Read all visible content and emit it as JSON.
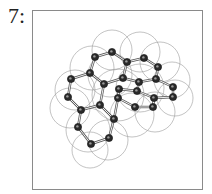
{
  "figure": {
    "label": "7:"
  },
  "atoms": [
    [
      95,
      57
    ],
    [
      112,
      52
    ],
    [
      127,
      62
    ],
    [
      144,
      58
    ],
    [
      158,
      67
    ],
    [
      90,
      73
    ],
    [
      71,
      79
    ],
    [
      104,
      84
    ],
    [
      123,
      78
    ],
    [
      139,
      82
    ],
    [
      156,
      79
    ],
    [
      173,
      87
    ],
    [
      68,
      97
    ],
    [
      119,
      89
    ],
    [
      137,
      91
    ],
    [
      118,
      98
    ],
    [
      154,
      98
    ],
    [
      173,
      97
    ],
    [
      81,
      110
    ],
    [
      100,
      105
    ],
    [
      135,
      107
    ],
    [
      153,
      107
    ],
    [
      114,
      119
    ],
    [
      78,
      127
    ],
    [
      109,
      138
    ],
    [
      91,
      144
    ]
  ],
  "bonds": [
    [
      0,
      1
    ],
    [
      1,
      2
    ],
    [
      2,
      3
    ],
    [
      3,
      4
    ],
    [
      0,
      5
    ],
    [
      5,
      6
    ],
    [
      6,
      12
    ],
    [
      12,
      18
    ],
    [
      18,
      23
    ],
    [
      23,
      25
    ],
    [
      25,
      24
    ],
    [
      24,
      22
    ],
    [
      22,
      19
    ],
    [
      19,
      7
    ],
    [
      7,
      8
    ],
    [
      8,
      2
    ],
    [
      8,
      9
    ],
    [
      9,
      10
    ],
    [
      10,
      4
    ],
    [
      10,
      11
    ],
    [
      11,
      17
    ],
    [
      17,
      16
    ],
    [
      16,
      21
    ],
    [
      21,
      20
    ],
    [
      20,
      15
    ],
    [
      15,
      13
    ],
    [
      13,
      14
    ],
    [
      14,
      9
    ],
    [
      14,
      16
    ],
    [
      18,
      19
    ],
    [
      5,
      7
    ],
    [
      22,
      15
    ]
  ],
  "surface_circles": [
    [
      92,
      68,
      22
    ],
    [
      75,
      90,
      20
    ],
    [
      70,
      108,
      20
    ],
    [
      88,
      130,
      22
    ],
    [
      108,
      140,
      20
    ],
    [
      90,
      150,
      18
    ],
    [
      112,
      50,
      20
    ],
    [
      140,
      52,
      20
    ],
    [
      160,
      62,
      20
    ],
    [
      172,
      80,
      18
    ],
    [
      175,
      98,
      18
    ],
    [
      155,
      112,
      20
    ],
    [
      132,
      115,
      22
    ],
    [
      118,
      95,
      26
    ],
    [
      140,
      88,
      24
    ],
    [
      110,
      75,
      22
    ]
  ]
}
